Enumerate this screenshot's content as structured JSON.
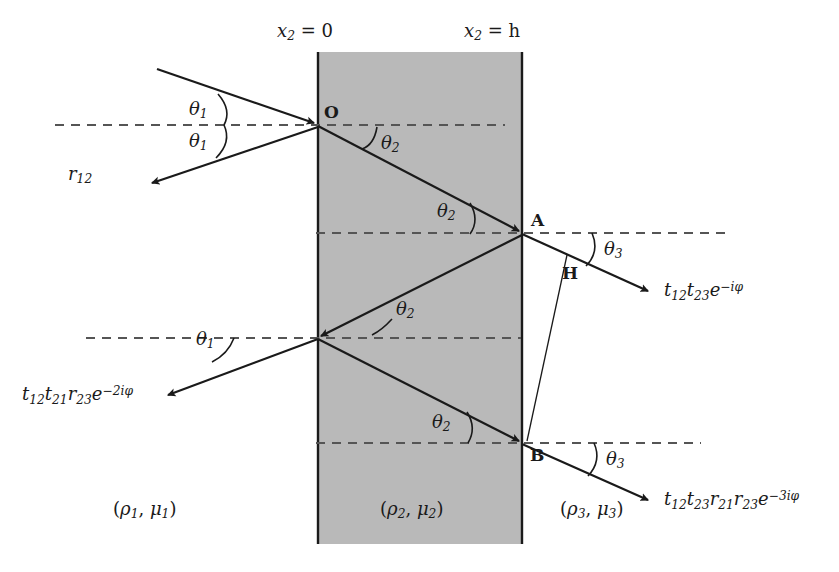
{
  "figure": {
    "slab_fill": "#b9b9b9",
    "line_color": "#1a1a1a",
    "dash_color": "#555555",
    "background": "#ffffff"
  },
  "boundaries": [
    {
      "id": "left-boundary",
      "label_x2": "x",
      "label_sub": "2",
      "label_eq": "= 0",
      "x": 318
    },
    {
      "id": "right-boundary",
      "label_x2": "x",
      "label_sub": "2",
      "label_eq": "= h",
      "x": 522
    }
  ],
  "media": [
    {
      "id": "medium-1",
      "rho": "ρ",
      "rho_sub": "1",
      "mu": "μ",
      "mu_sub": "1"
    },
    {
      "id": "medium-2",
      "rho": "ρ",
      "rho_sub": "2",
      "mu": "μ",
      "mu_sub": "2"
    },
    {
      "id": "medium-3",
      "rho": "ρ",
      "rho_sub": "3",
      "mu": "μ",
      "mu_sub": "3"
    }
  ],
  "points": [
    {
      "id": "point-O",
      "label": "O"
    },
    {
      "id": "point-A",
      "label": "A"
    },
    {
      "id": "point-B",
      "label": "B"
    },
    {
      "id": "point-H",
      "label": "H"
    }
  ],
  "angles": [
    {
      "id": "angle-theta1-incident",
      "sym": "θ",
      "sub": "1"
    },
    {
      "id": "angle-theta1-reflected",
      "sym": "θ",
      "sub": "1"
    },
    {
      "id": "angle-theta2-upper",
      "sym": "θ",
      "sub": "2"
    },
    {
      "id": "angle-theta2-at-A",
      "sym": "θ",
      "sub": "2"
    },
    {
      "id": "angle-theta2-mid",
      "sym": "θ",
      "sub": "2"
    },
    {
      "id": "angle-theta2-lower",
      "sym": "θ",
      "sub": "2"
    },
    {
      "id": "angle-theta1-lower",
      "sym": "θ",
      "sub": "1"
    },
    {
      "id": "angle-theta3-upper",
      "sym": "θ",
      "sub": "3"
    },
    {
      "id": "angle-theta3-lower",
      "sym": "θ",
      "sub": "3"
    }
  ],
  "rays": {
    "reflected_first": {
      "id": "ray-r12",
      "parts": [
        {
          "t": "r",
          "sub": "12"
        }
      ]
    },
    "transmitted_first": {
      "id": "ray-t12t23",
      "parts": [
        {
          "t": "t",
          "sub": "12"
        },
        {
          "t": "t",
          "sub": "23"
        },
        {
          "t": "e",
          "sup": "−iφ"
        }
      ]
    },
    "reflected_second": {
      "id": "ray-t12t21r23",
      "parts": [
        {
          "t": "t",
          "sub": "12"
        },
        {
          "t": "t",
          "sub": "21"
        },
        {
          "t": "r",
          "sub": "23"
        },
        {
          "t": "e",
          "sup": "−2iφ"
        }
      ]
    },
    "transmitted_second": {
      "id": "ray-t12t23r21r23",
      "parts": [
        {
          "t": "t",
          "sub": "12"
        },
        {
          "t": "t",
          "sub": "23"
        },
        {
          "t": "r",
          "sub": "21"
        },
        {
          "t": "r",
          "sub": "23"
        },
        {
          "t": "e",
          "sup": "−3iφ"
        }
      ]
    }
  }
}
